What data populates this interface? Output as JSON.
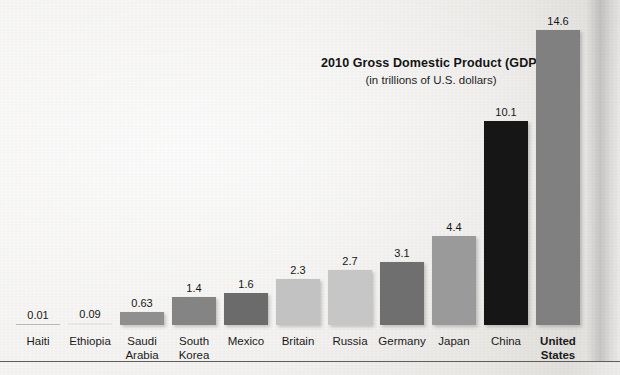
{
  "chart_data": {
    "type": "bar",
    "title": "2010 Gross Domestic Product (GDP)",
    "subtitle": "(in trillions of U.S. dollars)",
    "xlabel": "",
    "ylabel": "",
    "ylim": [
      0,
      14.6
    ],
    "grid": false,
    "legend": null,
    "units": "trillions of U.S. dollars",
    "categories": [
      "Haiti",
      "Ethiopia",
      "Saudi\nArabia",
      "South\nKorea",
      "Mexico",
      "Britain",
      "Russia",
      "Germany",
      "Japan",
      "China",
      "United\nStates"
    ],
    "values": [
      0.01,
      0.09,
      0.63,
      1.4,
      1.6,
      2.3,
      2.7,
      3.1,
      4.4,
      10.1,
      14.6
    ],
    "value_labels": [
      "0.01",
      "0.09",
      "0.63",
      "1.4",
      "1.6",
      "2.3",
      "2.7",
      "3.1",
      "4.4",
      "10.1",
      "14.6"
    ],
    "bar_colors": [
      "#b9b9b9",
      "#e7e6e4",
      "#8f8f8f",
      "#848484",
      "#6b6b6b",
      "#c2c2c2",
      "#c6c6c6",
      "#6f6f6f",
      "#9a9a9a",
      "#161616",
      "#808080"
    ],
    "bars": [
      {
        "category": "Haiti",
        "label": "Haiti",
        "value": 0.01,
        "value_label": "0.01",
        "color": "#b9b9b9",
        "bold_label": false
      },
      {
        "category": "Ethiopia",
        "label": "Ethiopia",
        "value": 0.09,
        "value_label": "0.09",
        "color": "#e7e6e4",
        "bold_label": false
      },
      {
        "category": "Saudi Arabia",
        "label": "Saudi\nArabia",
        "value": 0.63,
        "value_label": "0.63",
        "color": "#8f8f8f",
        "bold_label": false
      },
      {
        "category": "South Korea",
        "label": "South\nKorea",
        "value": 1.4,
        "value_label": "1.4",
        "color": "#848484",
        "bold_label": false
      },
      {
        "category": "Mexico",
        "label": "Mexico",
        "value": 1.6,
        "value_label": "1.6",
        "color": "#6b6b6b",
        "bold_label": false
      },
      {
        "category": "Britain",
        "label": "Britain",
        "value": 2.3,
        "value_label": "2.3",
        "color": "#c2c2c2",
        "bold_label": false
      },
      {
        "category": "Russia",
        "label": "Russia",
        "value": 2.7,
        "value_label": "2.7",
        "color": "#c6c6c6",
        "bold_label": false
      },
      {
        "category": "Germany",
        "label": "Germany",
        "value": 3.1,
        "value_label": "3.1",
        "color": "#6f6f6f",
        "bold_label": false
      },
      {
        "category": "Japan",
        "label": "Japan",
        "value": 4.4,
        "value_label": "4.4",
        "color": "#9a9a9a",
        "bold_label": false
      },
      {
        "category": "China",
        "label": "China",
        "value": 10.1,
        "value_label": "10.1",
        "color": "#161616",
        "bold_label": false
      },
      {
        "category": "United States",
        "label": "United\nStates",
        "value": 14.6,
        "value_label": "14.6",
        "color": "#808080",
        "bold_label": true
      }
    ]
  },
  "layout": {
    "baseline_y": 325,
    "max_bar_height_px": 295,
    "bar_width_px": 44,
    "first_bar_center_x": 38,
    "bar_pitch_px": 52,
    "bottom_rule_y": 361
  }
}
